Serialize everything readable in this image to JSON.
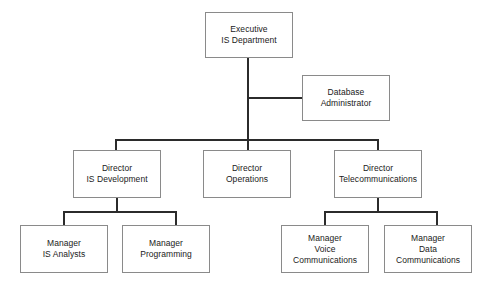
{
  "diagram": {
    "type": "organization-chart",
    "style": {
      "background": "#ffffff",
      "box_border": "#8a8a8a",
      "connector": "#2b2b2b",
      "text": "#1a1a1a"
    },
    "nodes": [
      {
        "id": "executive",
        "level": 0,
        "lines": [
          "Executive",
          "IS Department"
        ],
        "x": 205,
        "y": 12,
        "w": 88,
        "h": 46
      },
      {
        "id": "database-administrator",
        "level": 1,
        "lines": [
          "Database",
          "Administrator"
        ],
        "x": 302,
        "y": 75,
        "w": 88,
        "h": 46
      },
      {
        "id": "director-is-development",
        "level": 2,
        "lines": [
          "Director",
          "IS Development"
        ],
        "x": 73,
        "y": 150,
        "w": 88,
        "h": 48
      },
      {
        "id": "director-operations",
        "level": 2,
        "lines": [
          "Director",
          "Operations"
        ],
        "x": 203,
        "y": 150,
        "w": 88,
        "h": 48
      },
      {
        "id": "director-telecommunications",
        "level": 2,
        "lines": [
          "Director",
          "Telecommunications"
        ],
        "x": 334,
        "y": 150,
        "w": 88,
        "h": 48
      },
      {
        "id": "manager-is-analysts",
        "level": 3,
        "lines": [
          "Manager",
          "IS Analysts"
        ],
        "x": 20,
        "y": 225,
        "w": 88,
        "h": 48
      },
      {
        "id": "manager-programming",
        "level": 3,
        "lines": [
          "Manager",
          "Programming"
        ],
        "x": 122,
        "y": 225,
        "w": 88,
        "h": 48
      },
      {
        "id": "manager-voice-communications",
        "level": 3,
        "lines": [
          "Manager",
          "Voice",
          "Communications"
        ],
        "x": 281,
        "y": 225,
        "w": 88,
        "h": 48
      },
      {
        "id": "manager-data-communications",
        "level": 3,
        "lines": [
          "Manager",
          "Data",
          "Communications"
        ],
        "x": 384,
        "y": 225,
        "w": 88,
        "h": 48
      }
    ],
    "edges": [
      {
        "from": "executive",
        "to": "database-administrator"
      },
      {
        "from": "executive",
        "to": "director-is-development"
      },
      {
        "from": "executive",
        "to": "director-operations"
      },
      {
        "from": "executive",
        "to": "director-telecommunications"
      },
      {
        "from": "director-is-development",
        "to": "manager-is-analysts"
      },
      {
        "from": "director-is-development",
        "to": "manager-programming"
      },
      {
        "from": "director-telecommunications",
        "to": "manager-voice-communications"
      },
      {
        "from": "director-telecommunications",
        "to": "manager-data-communications"
      }
    ]
  }
}
